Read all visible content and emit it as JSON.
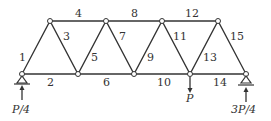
{
  "diagram": {
    "type": "truss",
    "members": [
      "1",
      "2",
      "3",
      "4",
      "5",
      "6",
      "7",
      "8",
      "9",
      "10",
      "11",
      "12",
      "13",
      "14",
      "15"
    ],
    "loads": {
      "left_reaction": "P/4",
      "applied_load": "P",
      "right_reaction": "3P/4"
    },
    "colors": {
      "line": "#333333",
      "node_fill": "#ffffff"
    }
  }
}
